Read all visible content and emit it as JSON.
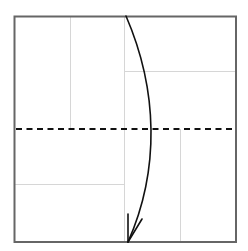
{
  "diagram": {
    "type": "origami-fold-step",
    "description": "Valley fold top half down to bottom edge",
    "colors": {
      "paper_edge": "#666666",
      "crease": "#d6d6d6",
      "fold_line": "#111111",
      "arrow": "#111111",
      "background": "#ffffff"
    },
    "paper": {
      "x": 14,
      "y": 16,
      "width": 222,
      "height": 226
    },
    "creases": [
      {
        "name": "vertical-crease-left",
        "x1": 70,
        "y1": 16,
        "x2": 70,
        "y2": 129
      },
      {
        "name": "vertical-crease-center",
        "x1": 124,
        "y1": 16,
        "x2": 124,
        "y2": 242
      },
      {
        "name": "vertical-crease-right",
        "x1": 180,
        "y1": 129,
        "x2": 180,
        "y2": 242
      },
      {
        "name": "horizontal-crease-upper-right",
        "x1": 124,
        "y1": 71,
        "x2": 236,
        "y2": 71
      },
      {
        "name": "horizontal-crease-lower-left",
        "x1": 14,
        "y1": 184,
        "x2": 124,
        "y2": 184
      }
    ],
    "valley_fold_line": {
      "x1": 14,
      "y1": 129,
      "x2": 236,
      "y2": 129,
      "style": "dashed"
    },
    "fold_arrow": {
      "from": [
        126,
        16
      ],
      "to": [
        128,
        242
      ],
      "direction": "down"
    }
  }
}
